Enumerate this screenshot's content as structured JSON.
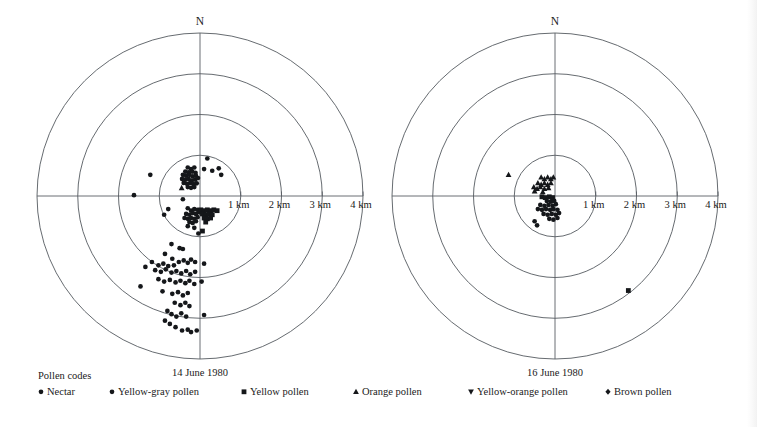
{
  "figure": {
    "legend_title": "Pollen codes",
    "north_label": "N",
    "ring_labels": [
      "1 km",
      "2 km",
      "3 km",
      "4 km"
    ],
    "legend": [
      {
        "label": "Nectar",
        "symbol": "circle",
        "color": "#15171a"
      },
      {
        "label": "Yellow-gray pollen",
        "symbol": "circle",
        "color": "#15171a"
      },
      {
        "label": "Yellow pollen",
        "symbol": "square",
        "color": "#15171a"
      },
      {
        "label": "Orange pollen",
        "symbol": "triangle-up",
        "color": "#15171a"
      },
      {
        "label": "Yellow-orange pollen",
        "symbol": "triangle-down",
        "color": "#15171a"
      },
      {
        "label": "Brown pollen",
        "symbol": "diamond",
        "color": "#15171a"
      }
    ]
  },
  "chart_data": [
    {
      "type": "scatter",
      "title": "14 June 1980",
      "projection": "polar",
      "units": "km",
      "rings": [
        1,
        2,
        3,
        4
      ],
      "rlim": [
        0,
        4
      ],
      "grid": true,
      "axes": [
        "N",
        "E",
        "S",
        "W"
      ],
      "center_label": "hive",
      "points": [
        {
          "x": -0.3,
          "y": 0.7,
          "symbol": "circle"
        },
        {
          "x": -0.22,
          "y": 0.66,
          "symbol": "circle"
        },
        {
          "x": -0.14,
          "y": 0.7,
          "symbol": "circle"
        },
        {
          "x": -0.36,
          "y": 0.6,
          "symbol": "circle"
        },
        {
          "x": -0.28,
          "y": 0.58,
          "symbol": "circle"
        },
        {
          "x": -0.19,
          "y": 0.6,
          "symbol": "circle"
        },
        {
          "x": -0.11,
          "y": 0.57,
          "symbol": "circle"
        },
        {
          "x": -0.42,
          "y": 0.52,
          "symbol": "circle"
        },
        {
          "x": -0.34,
          "y": 0.5,
          "symbol": "circle"
        },
        {
          "x": -0.26,
          "y": 0.52,
          "symbol": "circle"
        },
        {
          "x": -0.18,
          "y": 0.48,
          "symbol": "circle"
        },
        {
          "x": -0.1,
          "y": 0.5,
          "symbol": "circle"
        },
        {
          "x": -0.44,
          "y": 0.42,
          "symbol": "circle"
        },
        {
          "x": -0.36,
          "y": 0.4,
          "symbol": "circle"
        },
        {
          "x": -0.28,
          "y": 0.42,
          "symbol": "circle"
        },
        {
          "x": -0.2,
          "y": 0.38,
          "symbol": "circle"
        },
        {
          "x": -0.12,
          "y": 0.4,
          "symbol": "circle"
        },
        {
          "x": -0.05,
          "y": 0.44,
          "symbol": "circle"
        },
        {
          "x": -0.4,
          "y": 0.32,
          "symbol": "circle"
        },
        {
          "x": -0.32,
          "y": 0.3,
          "symbol": "circle"
        },
        {
          "x": -0.24,
          "y": 0.32,
          "symbol": "circle"
        },
        {
          "x": -0.16,
          "y": 0.29,
          "symbol": "circle"
        },
        {
          "x": -0.08,
          "y": 0.31,
          "symbol": "circle"
        },
        {
          "x": -0.3,
          "y": 0.22,
          "symbol": "circle"
        },
        {
          "x": -0.22,
          "y": 0.2,
          "symbol": "circle"
        },
        {
          "x": -0.14,
          "y": 0.22,
          "symbol": "circle"
        },
        {
          "x": -0.45,
          "y": 0.2,
          "symbol": "triangle-up"
        },
        {
          "x": 0.1,
          "y": 0.66,
          "symbol": "circle"
        },
        {
          "x": 0.3,
          "y": 0.62,
          "symbol": "circle"
        },
        {
          "x": 0.46,
          "y": 0.68,
          "symbol": "circle"
        },
        {
          "x": 0.52,
          "y": 0.52,
          "symbol": "circle"
        },
        {
          "x": 0.18,
          "y": 0.92,
          "symbol": "circle"
        },
        {
          "x": -1.22,
          "y": 0.52,
          "symbol": "circle"
        },
        {
          "x": -1.62,
          "y": 0.02,
          "symbol": "circle"
        },
        {
          "x": -0.42,
          "y": -0.08,
          "symbol": "circle"
        },
        {
          "x": -0.78,
          "y": -0.32,
          "symbol": "circle"
        },
        {
          "x": -0.88,
          "y": -0.46,
          "symbol": "circle"
        },
        {
          "x": -0.3,
          "y": -0.3,
          "symbol": "circle"
        },
        {
          "x": -0.22,
          "y": -0.36,
          "symbol": "circle"
        },
        {
          "x": -0.14,
          "y": -0.32,
          "symbol": "circle"
        },
        {
          "x": -0.06,
          "y": -0.34,
          "symbol": "circle"
        },
        {
          "x": -0.34,
          "y": -0.44,
          "symbol": "circle"
        },
        {
          "x": -0.26,
          "y": -0.46,
          "symbol": "circle"
        },
        {
          "x": -0.18,
          "y": -0.42,
          "symbol": "circle"
        },
        {
          "x": -0.1,
          "y": -0.44,
          "symbol": "circle"
        },
        {
          "x": -0.02,
          "y": -0.4,
          "symbol": "circle"
        },
        {
          "x": -0.38,
          "y": -0.54,
          "symbol": "circle"
        },
        {
          "x": -0.3,
          "y": -0.56,
          "symbol": "circle"
        },
        {
          "x": -0.22,
          "y": -0.54,
          "symbol": "circle"
        },
        {
          "x": -0.14,
          "y": -0.56,
          "symbol": "circle"
        },
        {
          "x": -0.06,
          "y": -0.52,
          "symbol": "circle"
        },
        {
          "x": -0.26,
          "y": -0.64,
          "symbol": "circle"
        },
        {
          "x": -0.18,
          "y": -0.66,
          "symbol": "circle"
        },
        {
          "x": -0.1,
          "y": -0.62,
          "symbol": "circle"
        },
        {
          "x": -0.3,
          "y": -0.74,
          "symbol": "circle"
        },
        {
          "x": -0.14,
          "y": -0.78,
          "symbol": "circle"
        },
        {
          "x": 0.02,
          "y": -0.34,
          "symbol": "square"
        },
        {
          "x": 0.1,
          "y": -0.36,
          "symbol": "square"
        },
        {
          "x": 0.18,
          "y": -0.34,
          "symbol": "square"
        },
        {
          "x": 0.26,
          "y": -0.36,
          "symbol": "square"
        },
        {
          "x": 0.34,
          "y": -0.34,
          "symbol": "square"
        },
        {
          "x": 0.42,
          "y": -0.36,
          "symbol": "square"
        },
        {
          "x": 0.06,
          "y": -0.44,
          "symbol": "square"
        },
        {
          "x": 0.14,
          "y": -0.46,
          "symbol": "square"
        },
        {
          "x": 0.22,
          "y": -0.44,
          "symbol": "square"
        },
        {
          "x": 0.3,
          "y": -0.46,
          "symbol": "square"
        },
        {
          "x": 0.1,
          "y": -0.54,
          "symbol": "square"
        },
        {
          "x": 0.18,
          "y": -0.56,
          "symbol": "square"
        },
        {
          "x": 0.26,
          "y": -0.54,
          "symbol": "square"
        },
        {
          "x": 0.14,
          "y": -0.64,
          "symbol": "square"
        },
        {
          "x": 0.06,
          "y": -0.86,
          "symbol": "square"
        },
        {
          "x": -0.04,
          "y": -0.92,
          "symbol": "circle"
        },
        {
          "x": -0.7,
          "y": -1.18,
          "symbol": "circle"
        },
        {
          "x": -0.5,
          "y": -1.28,
          "symbol": "circle"
        },
        {
          "x": -0.42,
          "y": -1.3,
          "symbol": "circle"
        },
        {
          "x": -0.86,
          "y": -1.42,
          "symbol": "circle"
        },
        {
          "x": -0.68,
          "y": -1.54,
          "symbol": "circle"
        },
        {
          "x": -1.18,
          "y": -1.62,
          "symbol": "circle"
        },
        {
          "x": -1.02,
          "y": -1.7,
          "symbol": "circle"
        },
        {
          "x": -0.9,
          "y": -1.66,
          "symbol": "circle"
        },
        {
          "x": -0.78,
          "y": -1.72,
          "symbol": "circle"
        },
        {
          "x": -0.64,
          "y": -1.7,
          "symbol": "circle"
        },
        {
          "x": -0.52,
          "y": -1.62,
          "symbol": "circle"
        },
        {
          "x": -0.4,
          "y": -1.58,
          "symbol": "circle"
        },
        {
          "x": -0.3,
          "y": -1.64,
          "symbol": "circle"
        },
        {
          "x": -0.22,
          "y": -1.56,
          "symbol": "circle"
        },
        {
          "x": -0.12,
          "y": -1.62,
          "symbol": "circle"
        },
        {
          "x": 0.1,
          "y": -1.66,
          "symbol": "circle"
        },
        {
          "x": -1.34,
          "y": -1.74,
          "symbol": "circle"
        },
        {
          "x": -1.1,
          "y": -1.82,
          "symbol": "circle"
        },
        {
          "x": -0.96,
          "y": -1.86,
          "symbol": "circle"
        },
        {
          "x": -0.84,
          "y": -1.8,
          "symbol": "circle"
        },
        {
          "x": -0.7,
          "y": -1.88,
          "symbol": "circle"
        },
        {
          "x": -0.58,
          "y": -1.84,
          "symbol": "circle"
        },
        {
          "x": -0.46,
          "y": -1.9,
          "symbol": "circle"
        },
        {
          "x": -0.34,
          "y": -1.84,
          "symbol": "circle"
        },
        {
          "x": -0.24,
          "y": -1.92,
          "symbol": "circle"
        },
        {
          "x": -0.12,
          "y": -1.86,
          "symbol": "circle"
        },
        {
          "x": -1.02,
          "y": -2.04,
          "symbol": "circle"
        },
        {
          "x": -0.88,
          "y": -2.1,
          "symbol": "circle"
        },
        {
          "x": -0.74,
          "y": -2.06,
          "symbol": "circle"
        },
        {
          "x": -0.6,
          "y": -2.12,
          "symbol": "circle"
        },
        {
          "x": -0.48,
          "y": -2.08,
          "symbol": "circle"
        },
        {
          "x": -0.36,
          "y": -2.14,
          "symbol": "circle"
        },
        {
          "x": -0.26,
          "y": -2.08,
          "symbol": "circle"
        },
        {
          "x": -0.14,
          "y": -2.16,
          "symbol": "circle"
        },
        {
          "x": 0.04,
          "y": -2.1,
          "symbol": "circle"
        },
        {
          "x": -1.46,
          "y": -2.22,
          "symbol": "circle"
        },
        {
          "x": -0.92,
          "y": -2.34,
          "symbol": "circle"
        },
        {
          "x": -0.68,
          "y": -2.4,
          "symbol": "circle"
        },
        {
          "x": -0.54,
          "y": -2.36,
          "symbol": "circle"
        },
        {
          "x": -0.42,
          "y": -2.44,
          "symbol": "circle"
        },
        {
          "x": -0.3,
          "y": -2.38,
          "symbol": "circle"
        },
        {
          "x": -0.62,
          "y": -2.62,
          "symbol": "circle"
        },
        {
          "x": -0.48,
          "y": -2.68,
          "symbol": "circle"
        },
        {
          "x": -0.36,
          "y": -2.62,
          "symbol": "circle"
        },
        {
          "x": -0.26,
          "y": -2.7,
          "symbol": "circle"
        },
        {
          "x": -0.8,
          "y": -2.82,
          "symbol": "circle"
        },
        {
          "x": -0.7,
          "y": -2.9,
          "symbol": "circle"
        },
        {
          "x": -0.58,
          "y": -2.96,
          "symbol": "circle"
        },
        {
          "x": -0.46,
          "y": -2.88,
          "symbol": "circle"
        },
        {
          "x": -0.34,
          "y": -2.96,
          "symbol": "circle"
        },
        {
          "x": 0.1,
          "y": -2.92,
          "symbol": "circle"
        },
        {
          "x": -0.86,
          "y": -3.06,
          "symbol": "circle"
        },
        {
          "x": -0.74,
          "y": -3.14,
          "symbol": "circle"
        },
        {
          "x": -0.6,
          "y": -3.22,
          "symbol": "circle"
        },
        {
          "x": -0.44,
          "y": -3.3,
          "symbol": "circle"
        },
        {
          "x": -0.3,
          "y": -3.28,
          "symbol": "circle"
        },
        {
          "x": -0.22,
          "y": -3.34,
          "symbol": "circle"
        },
        {
          "x": -0.08,
          "y": -3.3,
          "symbol": "circle"
        }
      ]
    },
    {
      "type": "scatter",
      "title": "16 June 1980",
      "projection": "polar",
      "units": "km",
      "rings": [
        1,
        2,
        3,
        4
      ],
      "rlim": [
        0,
        4
      ],
      "grid": true,
      "axes": [
        "N",
        "E",
        "S",
        "W"
      ],
      "center_label": "hive",
      "points": [
        {
          "x": -1.14,
          "y": 0.52,
          "symbol": "triangle-up"
        },
        {
          "x": -0.34,
          "y": 0.46,
          "symbol": "triangle-up"
        },
        {
          "x": -0.26,
          "y": 0.42,
          "symbol": "triangle-up"
        },
        {
          "x": -0.18,
          "y": 0.46,
          "symbol": "triangle-up"
        },
        {
          "x": -0.1,
          "y": 0.42,
          "symbol": "triangle-up"
        },
        {
          "x": -0.04,
          "y": 0.46,
          "symbol": "triangle-up"
        },
        {
          "x": -0.42,
          "y": 0.32,
          "symbol": "triangle-up"
        },
        {
          "x": -0.34,
          "y": 0.28,
          "symbol": "triangle-up"
        },
        {
          "x": -0.26,
          "y": 0.32,
          "symbol": "triangle-up"
        },
        {
          "x": -0.18,
          "y": 0.28,
          "symbol": "triangle-up"
        },
        {
          "x": -0.1,
          "y": 0.32,
          "symbol": "triangle-up"
        },
        {
          "x": -0.52,
          "y": 0.22,
          "symbol": "triangle-up"
        },
        {
          "x": -0.44,
          "y": 0.18,
          "symbol": "triangle-up"
        },
        {
          "x": -0.36,
          "y": 0.22,
          "symbol": "triangle-up"
        },
        {
          "x": -0.26,
          "y": 0.18,
          "symbol": "triangle-up"
        },
        {
          "x": -0.16,
          "y": 0.2,
          "symbol": "triangle-up"
        },
        {
          "x": -0.5,
          "y": 0.12,
          "symbol": "triangle-up"
        },
        {
          "x": -0.3,
          "y": 0.1,
          "symbol": "triangle-up"
        },
        {
          "x": -0.32,
          "y": -0.02,
          "symbol": "square"
        },
        {
          "x": -0.24,
          "y": -0.04,
          "symbol": "square"
        },
        {
          "x": -0.14,
          "y": -0.02,
          "symbol": "square"
        },
        {
          "x": -0.06,
          "y": -0.04,
          "symbol": "square"
        },
        {
          "x": -0.2,
          "y": -0.12,
          "symbol": "circle"
        },
        {
          "x": -0.1,
          "y": -0.14,
          "symbol": "circle"
        },
        {
          "x": -0.02,
          "y": -0.12,
          "symbol": "circle"
        },
        {
          "x": -0.36,
          "y": -0.22,
          "symbol": "circle"
        },
        {
          "x": -0.26,
          "y": -0.24,
          "symbol": "circle"
        },
        {
          "x": -0.16,
          "y": -0.22,
          "symbol": "circle"
        },
        {
          "x": -0.06,
          "y": -0.24,
          "symbol": "circle"
        },
        {
          "x": 0.02,
          "y": -0.2,
          "symbol": "circle"
        },
        {
          "x": -0.42,
          "y": -0.32,
          "symbol": "circle"
        },
        {
          "x": -0.32,
          "y": -0.34,
          "symbol": "circle"
        },
        {
          "x": -0.22,
          "y": -0.32,
          "symbol": "circle"
        },
        {
          "x": -0.12,
          "y": -0.34,
          "symbol": "circle"
        },
        {
          "x": -0.04,
          "y": -0.32,
          "symbol": "circle"
        },
        {
          "x": 0.06,
          "y": -0.34,
          "symbol": "circle"
        },
        {
          "x": -0.28,
          "y": -0.44,
          "symbol": "circle"
        },
        {
          "x": -0.18,
          "y": -0.46,
          "symbol": "circle"
        },
        {
          "x": -0.08,
          "y": -0.44,
          "symbol": "circle"
        },
        {
          "x": 0.02,
          "y": -0.46,
          "symbol": "circle"
        },
        {
          "x": 0.1,
          "y": -0.42,
          "symbol": "circle"
        },
        {
          "x": -0.14,
          "y": -0.56,
          "symbol": "circle"
        },
        {
          "x": -0.04,
          "y": -0.58,
          "symbol": "circle"
        },
        {
          "x": 0.06,
          "y": -0.54,
          "symbol": "circle"
        },
        {
          "x": -0.5,
          "y": -0.62,
          "symbol": "circle"
        },
        {
          "x": -0.44,
          "y": -0.72,
          "symbol": "circle"
        },
        {
          "x": 1.8,
          "y": -2.32,
          "symbol": "square"
        }
      ]
    }
  ]
}
